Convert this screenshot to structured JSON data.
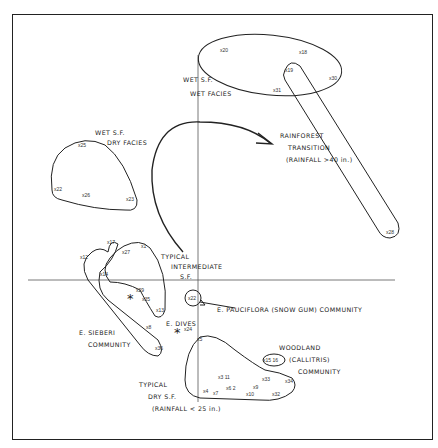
{
  "diagram": {
    "groups": [
      {
        "id": "wet-sf-wet-facies",
        "label_lines": [
          "WET S.F.",
          "WET FACIES"
        ],
        "points": [
          "20",
          "18",
          "19",
          "30",
          "31"
        ]
      },
      {
        "id": "wet-sf-dry-facies",
        "label_lines": [
          "WET S.F.",
          "DRY FACIES"
        ],
        "points": [
          "25",
          "22",
          "26",
          "23"
        ]
      },
      {
        "id": "rainforest-transition",
        "label_lines": [
          "RAINFOREST",
          "TRANSITION",
          "(RAINFALL >40 in.)"
        ],
        "points": [
          "19",
          "28"
        ]
      },
      {
        "id": "typical-intermediate-sf",
        "label_lines": [
          "TYPICAL",
          "INTERMEDIATE",
          "S.F."
        ],
        "points": [
          "27",
          "1",
          "14",
          "29",
          "35",
          "13"
        ]
      },
      {
        "id": "e-sieberi-community",
        "label_lines": [
          "E. SIEBERI",
          "COMMUNITY"
        ],
        "points": [
          "17",
          "12",
          "14",
          "8",
          "36"
        ]
      },
      {
        "id": "e-pauciflora-community",
        "label_lines": [
          "E. PAUCIFLORA (SNOW GUM) COMMUNITY"
        ],
        "points": [
          "22"
        ]
      },
      {
        "id": "e-dives",
        "label_lines": [
          "E. DIVES"
        ],
        "points": [
          "24"
        ]
      },
      {
        "id": "woodland-callitris-community",
        "label_lines": [
          "WOODLAND",
          "(CALLITRIS)",
          "COMMUNITY"
        ],
        "points": [
          "15",
          "16"
        ]
      },
      {
        "id": "typical-dry-sf",
        "label_lines": [
          "TYPICAL",
          "DRY S.F.",
          "(RAINFALL < 25 in.)"
        ],
        "points": [
          "5",
          "3",
          "11",
          "4",
          "7",
          "6",
          "2",
          "10",
          "9",
          "33",
          "34",
          "32"
        ]
      }
    ],
    "point_labels": {
      "p20": "x20",
      "p18": "x18",
      "p19": "x19",
      "p30": "x30",
      "p31": "x31",
      "p25": "x25",
      "p22a": "x22",
      "p26": "x26",
      "p23": "x23",
      "p28": "x28",
      "p17": "x17",
      "p12": "x12",
      "p27": "x27",
      "p1": "x1",
      "p14": "x14",
      "p29": "x29",
      "p35": "x35",
      "p13": "x13",
      "p8": "x8",
      "p36": "x36",
      "p22b": "x22",
      "p24": "x24",
      "p5": "x5",
      "p3_11": "x3 11",
      "p4": "x4",
      "p7": "x7",
      "p6_2": "x6 2",
      "p10": "x10",
      "p9": "x9",
      "p33": "x33",
      "p34": "x34",
      "p32": "x32",
      "p15_16": "x15 16"
    },
    "markers": {
      "asterisk": "*"
    }
  }
}
